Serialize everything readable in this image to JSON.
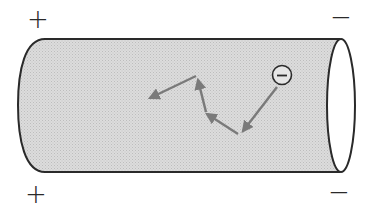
{
  "diagram": {
    "type": "conductor-electron-drift",
    "left_signs": [
      "+",
      "+"
    ],
    "right_signs": [
      "−",
      "−"
    ],
    "electron_symbol": "−",
    "colors": {
      "conductor_fill": "#d4d4d4",
      "outline": "#2a2a2a",
      "arrow": "#7a7a7a",
      "end_cap": "#ffffff"
    },
    "path_segments": 4
  }
}
